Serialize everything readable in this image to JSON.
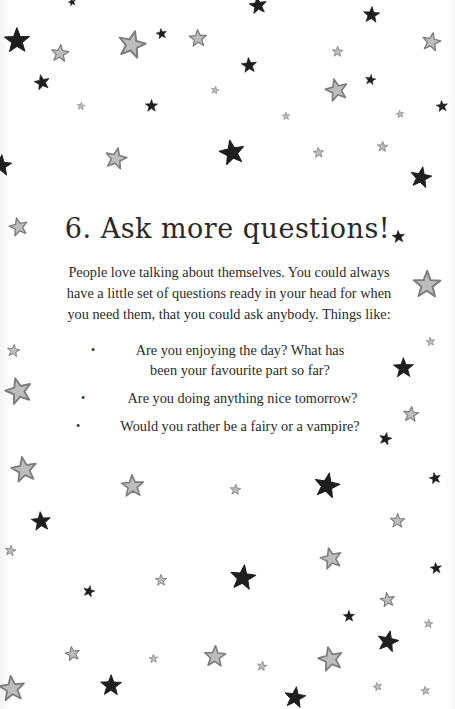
{
  "heading": {
    "title": "6. Ask more questions!"
  },
  "intro": {
    "paragraph": "People love talking about themselves. You could always have a little set of questions ready in your head for when you need them, that you could ask anybody. Things like:"
  },
  "bullets": {
    "marker": "•",
    "items": [
      {
        "line1": "Are you enjoying the day? What has",
        "line2": "been your favourite part so far?"
      },
      {
        "line1": "Are you doing anything nice tomorrow?"
      },
      {
        "line1": "Would you rather be a fairy or a vampire?"
      }
    ]
  },
  "colors": {
    "dark_star": "#1e1e1e",
    "grey_star_fill": "#bdbdbd",
    "grey_star_stroke": "#7c7c7c",
    "text": "#2b2b2b",
    "background": "#ffffff"
  },
  "stars": [
    {
      "x": 72,
      "y": 2,
      "s": 8,
      "t": "dark"
    },
    {
      "x": 258,
      "y": 5,
      "s": 18,
      "t": "dark"
    },
    {
      "x": 17,
      "y": 40,
      "s": 26,
      "t": "dark"
    },
    {
      "x": 60,
      "y": 53,
      "s": 18,
      "t": "grey"
    },
    {
      "x": 132,
      "y": 44,
      "s": 28,
      "t": "grey"
    },
    {
      "x": 161,
      "y": 33,
      "s": 11,
      "t": "dark"
    },
    {
      "x": 198,
      "y": 38,
      "s": 18,
      "t": "grey"
    },
    {
      "x": 371,
      "y": 14,
      "s": 17,
      "t": "dark"
    },
    {
      "x": 431,
      "y": 41,
      "s": 19,
      "t": "grey"
    },
    {
      "x": 42,
      "y": 82,
      "s": 16,
      "t": "dark"
    },
    {
      "x": 249,
      "y": 65,
      "s": 16,
      "t": "dark"
    },
    {
      "x": 337,
      "y": 51,
      "s": 11,
      "t": "grey"
    },
    {
      "x": 370,
      "y": 79,
      "s": 11,
      "t": "dark"
    },
    {
      "x": 336,
      "y": 89,
      "s": 23,
      "t": "grey"
    },
    {
      "x": 442,
      "y": 106,
      "s": 12,
      "t": "dark"
    },
    {
      "x": 151,
      "y": 105,
      "s": 13,
      "t": "dark"
    },
    {
      "x": 81,
      "y": 106,
      "s": 8,
      "t": "grey"
    },
    {
      "x": 215,
      "y": 90,
      "s": 8,
      "t": "grey"
    },
    {
      "x": 400,
      "y": 114,
      "s": 8,
      "t": "grey"
    },
    {
      "x": 286,
      "y": 116,
      "s": 8,
      "t": "grey"
    },
    {
      "x": 1,
      "y": 165,
      "s": 22,
      "t": "dark"
    },
    {
      "x": 116,
      "y": 158,
      "s": 22,
      "t": "grey"
    },
    {
      "x": 232,
      "y": 152,
      "s": 26,
      "t": "dark"
    },
    {
      "x": 318,
      "y": 152,
      "s": 11,
      "t": "grey"
    },
    {
      "x": 382,
      "y": 146,
      "s": 11,
      "t": "grey"
    },
    {
      "x": 421,
      "y": 177,
      "s": 22,
      "t": "dark"
    },
    {
      "x": 18,
      "y": 226,
      "s": 19,
      "t": "grey"
    },
    {
      "x": 398,
      "y": 236,
      "s": 13,
      "t": "dark"
    },
    {
      "x": 427,
      "y": 284,
      "s": 28,
      "t": "grey"
    },
    {
      "x": 13,
      "y": 350,
      "s": 13,
      "t": "grey"
    },
    {
      "x": 18,
      "y": 390,
      "s": 27,
      "t": "grey"
    },
    {
      "x": 430,
      "y": 341,
      "s": 9,
      "t": "grey"
    },
    {
      "x": 403,
      "y": 367,
      "s": 21,
      "t": "dark"
    },
    {
      "x": 411,
      "y": 414,
      "s": 16,
      "t": "grey"
    },
    {
      "x": 385,
      "y": 438,
      "s": 13,
      "t": "dark"
    },
    {
      "x": 24,
      "y": 469,
      "s": 26,
      "t": "grey"
    },
    {
      "x": 132,
      "y": 485,
      "s": 23,
      "t": "grey"
    },
    {
      "x": 235,
      "y": 489,
      "s": 11,
      "t": "grey"
    },
    {
      "x": 327,
      "y": 485,
      "s": 26,
      "t": "dark"
    },
    {
      "x": 435,
      "y": 478,
      "s": 12,
      "t": "dark"
    },
    {
      "x": 41,
      "y": 521,
      "s": 20,
      "t": "dark"
    },
    {
      "x": 397,
      "y": 520,
      "s": 15,
      "t": "grey"
    },
    {
      "x": 10,
      "y": 550,
      "s": 11,
      "t": "grey"
    },
    {
      "x": 331,
      "y": 558,
      "s": 22,
      "t": "grey"
    },
    {
      "x": 436,
      "y": 568,
      "s": 12,
      "t": "dark"
    },
    {
      "x": 161,
      "y": 580,
      "s": 12,
      "t": "grey"
    },
    {
      "x": 243,
      "y": 577,
      "s": 26,
      "t": "dark"
    },
    {
      "x": 89,
      "y": 591,
      "s": 12,
      "t": "dark"
    },
    {
      "x": 387,
      "y": 599,
      "s": 15,
      "t": "grey"
    },
    {
      "x": 349,
      "y": 616,
      "s": 12,
      "t": "dark"
    },
    {
      "x": 428,
      "y": 623,
      "s": 9,
      "t": "grey"
    },
    {
      "x": 388,
      "y": 641,
      "s": 22,
      "t": "dark"
    },
    {
      "x": 72,
      "y": 653,
      "s": 15,
      "t": "grey"
    },
    {
      "x": 153,
      "y": 658,
      "s": 9,
      "t": "grey"
    },
    {
      "x": 215,
      "y": 656,
      "s": 22,
      "t": "grey"
    },
    {
      "x": 262,
      "y": 666,
      "s": 10,
      "t": "grey"
    },
    {
      "x": 330,
      "y": 658,
      "s": 25,
      "t": "grey"
    },
    {
      "x": 12,
      "y": 688,
      "s": 26,
      "t": "grey"
    },
    {
      "x": 111,
      "y": 685,
      "s": 22,
      "t": "dark"
    },
    {
      "x": 295,
      "y": 697,
      "s": 22,
      "t": "dark"
    },
    {
      "x": 377,
      "y": 686,
      "s": 9,
      "t": "grey"
    },
    {
      "x": 425,
      "y": 690,
      "s": 9,
      "t": "grey"
    }
  ]
}
